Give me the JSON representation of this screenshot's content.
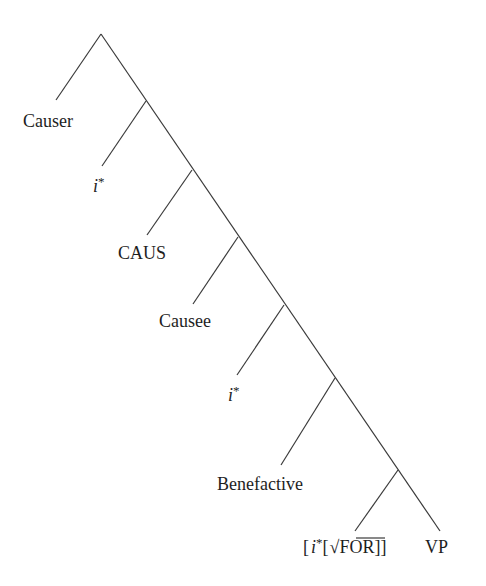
{
  "diagram": {
    "type": "syntax-tree",
    "nodes": [
      {
        "id": "n0",
        "x": 101,
        "y": 34
      },
      {
        "id": "n1",
        "x": 146,
        "y": 101
      },
      {
        "id": "n2",
        "x": 192,
        "y": 170
      },
      {
        "id": "n3",
        "x": 238,
        "y": 237
      },
      {
        "id": "n4",
        "x": 284,
        "y": 305
      },
      {
        "id": "n5",
        "x": 335,
        "y": 378
      },
      {
        "id": "n6",
        "x": 398,
        "y": 470
      }
    ],
    "leaves": [
      {
        "name": "causer",
        "label": "Causer",
        "parent": "n0",
        "end": [
          56,
          100
        ],
        "tx": 23,
        "ty": 127,
        "italic": false
      },
      {
        "name": "i-star-1",
        "label_i": "i",
        "label_rest": "*",
        "parent": "n1",
        "end": [
          102,
          166
        ],
        "tx": 93,
        "ty": 192,
        "italic": true
      },
      {
        "name": "caus",
        "label": "CAUS",
        "parent": "n2",
        "end": [
          147,
          235
        ],
        "tx": 118,
        "ty": 259,
        "italic": false
      },
      {
        "name": "causee",
        "label": "Causee",
        "parent": "n3",
        "end": [
          193,
          304
        ],
        "tx": 159,
        "ty": 327,
        "italic": false
      },
      {
        "name": "i-star-2",
        "label_i": "i",
        "label_rest": "*",
        "parent": "n4",
        "end": [
          237,
          375
        ],
        "tx": 228,
        "ty": 401,
        "italic": true
      },
      {
        "name": "benefactive",
        "label": "Benefactive",
        "parent": "n5",
        "end": [
          281,
          465
        ],
        "tx": 217,
        "ty": 490,
        "italic": false
      },
      {
        "name": "i-star-for",
        "parent": "n6",
        "end": [
          355,
          531
        ],
        "tx": 303,
        "ty": 553,
        "parts": {
          "open1": "[",
          "i": "i",
          "star": "*",
          "open2": "[",
          "root": "√",
          "word": "FOR",
          "close": "]]"
        }
      },
      {
        "name": "vp",
        "label": "VP",
        "parent": "n6",
        "end": [
          440,
          531
        ],
        "tx": 425,
        "ty": 553,
        "italic": false
      }
    ],
    "spine_end": [
      440,
      531
    ],
    "labels": {
      "causer": "Causer",
      "i1": "i",
      "star1": "*",
      "caus": "CAUS",
      "causee": "Causee",
      "i2": "i",
      "star2": "*",
      "benefactive": "Benefactive",
      "bracket_open": "[",
      "i3": "i",
      "star3": "*",
      "bracket_open2": "[",
      "root_sign": "√",
      "for_word": "FOR",
      "bracket_close": "]]",
      "vp": "VP"
    }
  }
}
